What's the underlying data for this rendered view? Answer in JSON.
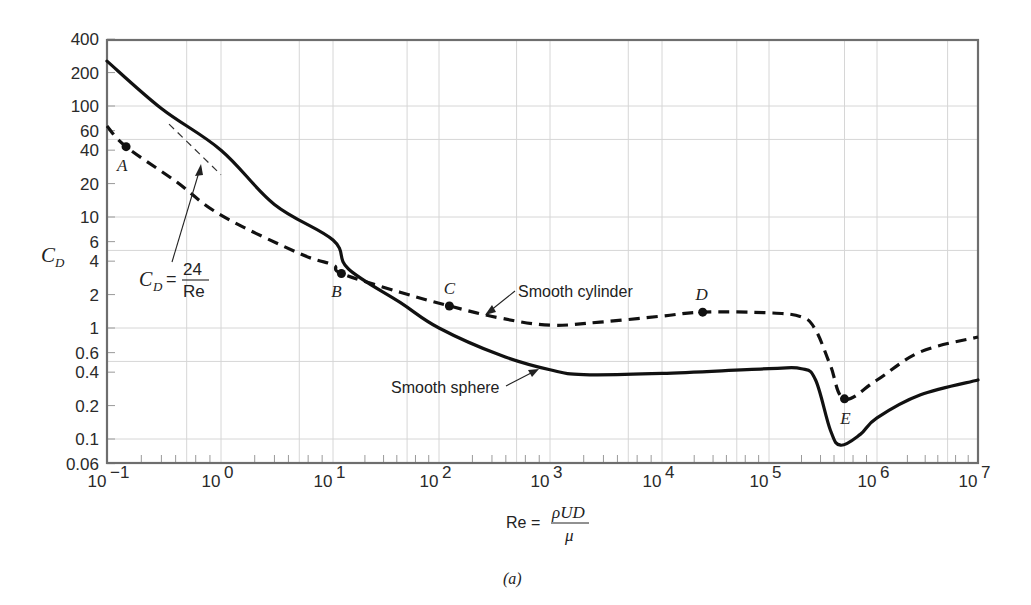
{
  "chart_data": {
    "type": "line",
    "title": "",
    "subtitle": "",
    "caption": "(a)",
    "xlabel": "Re = ρUD/μ",
    "xlabel_parts": {
      "lhs": "Re =",
      "numerator": "ρUD",
      "denominator": "μ"
    },
    "ylabel": "C_D",
    "ylabel_parts": {
      "main": "C",
      "sub": "D"
    },
    "xscale": "log",
    "yscale": "log",
    "xlim": [
      0.1,
      10000000
    ],
    "ylim": [
      0.06,
      400
    ],
    "grid": true,
    "legend": "inline annotations",
    "x_ticks": [
      {
        "exp": -1,
        "base": "10",
        "sup": "−1"
      },
      {
        "exp": 0,
        "base": "10",
        "sup": "0"
      },
      {
        "exp": 1,
        "base": "10",
        "sup": "1"
      },
      {
        "exp": 2,
        "base": "10",
        "sup": "2"
      },
      {
        "exp": 3,
        "base": "10",
        "sup": "3"
      },
      {
        "exp": 4,
        "base": "10",
        "sup": "4"
      },
      {
        "exp": 5,
        "base": "10",
        "sup": "5"
      },
      {
        "exp": 6,
        "base": "10",
        "sup": "6"
      },
      {
        "exp": 7,
        "base": "10",
        "sup": "7"
      }
    ],
    "y_ticks": [
      {
        "value": 400,
        "label": "400"
      },
      {
        "value": 200,
        "label": "200"
      },
      {
        "value": 100,
        "label": "100"
      },
      {
        "value": 60,
        "label": "60"
      },
      {
        "value": 40,
        "label": "40"
      },
      {
        "value": 20,
        "label": "20"
      },
      {
        "value": 10,
        "label": "10"
      },
      {
        "value": 6,
        "label": "6"
      },
      {
        "value": 4,
        "label": "4"
      },
      {
        "value": 2,
        "label": "2"
      },
      {
        "value": 1,
        "label": "1"
      },
      {
        "value": 0.6,
        "label": "0.6"
      },
      {
        "value": 0.4,
        "label": "0.4"
      },
      {
        "value": 0.2,
        "label": "0.2"
      },
      {
        "value": 0.1,
        "label": "0.1"
      },
      {
        "value": 0.06,
        "label": "0.06"
      }
    ],
    "series": [
      {
        "name": "Smooth sphere",
        "style": "solid",
        "points": [
          [
            0.1,
            254
          ],
          [
            0.3,
            95
          ],
          [
            1,
            40
          ],
          [
            3,
            13
          ],
          [
            10,
            6.2
          ],
          [
            14,
            3.4
          ],
          [
            43,
            1.7
          ],
          [
            100,
            1.0
          ],
          [
            355,
            0.57
          ],
          [
            1000,
            0.42
          ],
          [
            2000,
            0.38
          ],
          [
            10000,
            0.39
          ],
          [
            100000,
            0.43
          ],
          [
            200000,
            0.43
          ],
          [
            270000,
            0.34
          ],
          [
            370000,
            0.12
          ],
          [
            460000,
            0.088
          ],
          [
            700000,
            0.11
          ],
          [
            1000000,
            0.155
          ],
          [
            2700000,
            0.25
          ],
          [
            10000000,
            0.34
          ]
        ]
      },
      {
        "name": "Smooth cylinder",
        "style": "dashed",
        "points": [
          [
            0.1,
            66
          ],
          [
            0.147,
            43
          ],
          [
            0.4,
            21
          ],
          [
            1,
            10.4
          ],
          [
            5,
            4.7
          ],
          [
            10,
            3.7
          ],
          [
            12,
            3.1
          ],
          [
            43,
            2.1
          ],
          [
            124,
            1.58
          ],
          [
            355,
            1.23
          ],
          [
            1000,
            1.06
          ],
          [
            2800,
            1.13
          ],
          [
            10000,
            1.28
          ],
          [
            24000,
            1.39
          ],
          [
            100000,
            1.37
          ],
          [
            200000,
            1.26
          ],
          [
            270000,
            0.96
          ],
          [
            370000,
            0.46
          ],
          [
            500000,
            0.23
          ],
          [
            1000000,
            0.34
          ],
          [
            2700000,
            0.61
          ],
          [
            10000000,
            0.83
          ]
        ]
      },
      {
        "name": "C_D = 24/Re",
        "style": "thin-dashed",
        "points": [
          [
            0.35,
            68.6
          ],
          [
            1.0,
            24
          ]
        ]
      }
    ],
    "marked_points": [
      {
        "label": "A",
        "re": 0.147,
        "cd": 43,
        "dx": -4,
        "dy": 24
      },
      {
        "label": "B",
        "re": 12,
        "cd": 3.1,
        "dx": -5,
        "dy": 24
      },
      {
        "label": "C",
        "re": 124,
        "cd": 1.58,
        "dx": 0,
        "dy": -12
      },
      {
        "label": "D",
        "re": 24000,
        "cd": 1.39,
        "dx": -1,
        "dy": -12
      },
      {
        "label": "E",
        "re": 500000,
        "cd": 0.23,
        "dx": 1,
        "dy": 25
      }
    ],
    "annotations": [
      {
        "text": "Smooth cylinder",
        "x": 518,
        "y": 297
      },
      {
        "text": "Smooth sphere",
        "x": 391,
        "y": 393
      }
    ],
    "formula_label": {
      "lhs_main": "C",
      "lhs_sub": "D",
      "eq": "=",
      "numerator": "24",
      "denominator": "Re"
    }
  }
}
